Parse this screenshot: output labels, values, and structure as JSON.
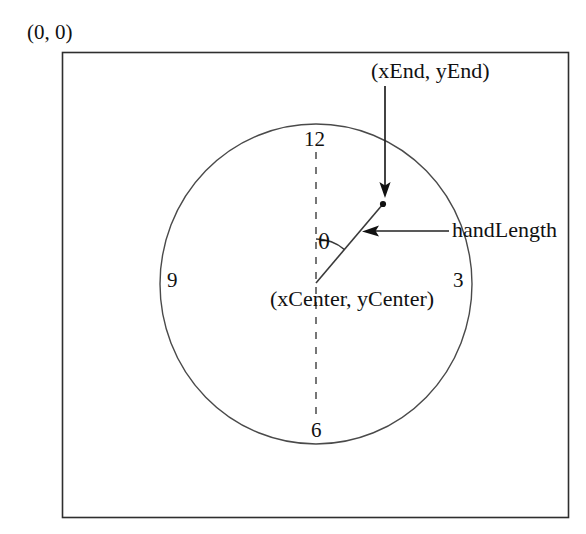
{
  "figure": {
    "title_none": "",
    "type": "diagram",
    "background_color": "#ffffff",
    "stroke_color": "#3a3a3a",
    "text_color": "#111111"
  },
  "labels": {
    "origin": "(0, 0)",
    "end_point": "(xEnd, yEnd)",
    "hand_length": "handLength",
    "center_point": "(xCenter, yCenter)",
    "theta": "θ"
  },
  "clock_numbers": {
    "twelve": "12",
    "three": "3",
    "six": "6",
    "nine": "9"
  },
  "geometry": {
    "panel": {
      "x": 62,
      "y": 52,
      "width": 506,
      "height": 465
    },
    "circle": {
      "cx": 316,
      "cy": 284,
      "rx": 156,
      "ry": 160
    },
    "center_point": {
      "x": 316,
      "y": 283
    },
    "end_point": {
      "x": 383,
      "y": 204
    },
    "dashed_vertical": {
      "x": 316,
      "y_top": 152,
      "y_bottom": 420
    },
    "hand_angle_degrees": 40,
    "xend_arrow": {
      "x": 385,
      "y_start": 86,
      "y_end": 196
    },
    "handlength_arrow": {
      "x_start": 449,
      "x_end": 364,
      "y": 231
    },
    "angle_arc_radius": 44
  }
}
